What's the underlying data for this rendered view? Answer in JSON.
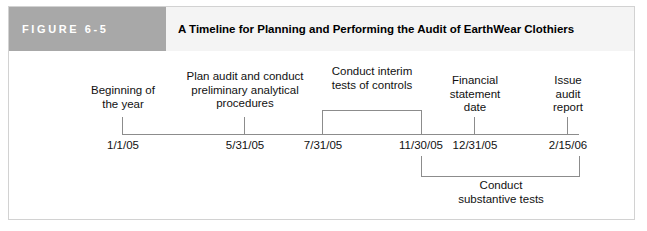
{
  "header": {
    "figure_number": "FIGURE 6-5",
    "title": "A Timeline for Planning and Performing the Audit of EarthWear Clothiers",
    "number_block_color": "#a8a8a8",
    "title_block_color": "#f4f4f4",
    "title_text_color": "#000000",
    "number_text_color": "#ffffff"
  },
  "timeline": {
    "axis_color": "#8c8c8c",
    "text_color": "#111111",
    "milestones": [
      {
        "id": "beginning-of-year",
        "label": "Beginning of\nthe year",
        "date": "1/1/05",
        "x": 113
      },
      {
        "id": "plan-audit",
        "label": "Plan audit and conduct\npreliminary analytical\nprocedures",
        "date": "5/31/05",
        "x": 235
      },
      {
        "id": "interim-start",
        "label": "",
        "date": "7/31/05",
        "x": 313
      },
      {
        "id": "interim-end",
        "label": "",
        "date": "11/30/05",
        "x": 412
      },
      {
        "id": "financial-statement-date",
        "label": "Financial\nstatement\ndate",
        "date": "12/31/05",
        "x": 465
      },
      {
        "id": "issue-audit-report",
        "label": "Issue\naudit\nreport",
        "date": "2/15/06",
        "x": 558
      }
    ],
    "brackets": [
      {
        "id": "conduct-interim-tests",
        "caption": "Conduct interim\ntests of controls",
        "from_date": "7/31/05",
        "to_date": "11/30/05",
        "position": "above"
      },
      {
        "id": "conduct-substantive-tests",
        "caption": "Conduct\nsubstantive tests",
        "from_date": "11/30/05",
        "to_date": "2/15/06",
        "position": "below"
      }
    ]
  }
}
